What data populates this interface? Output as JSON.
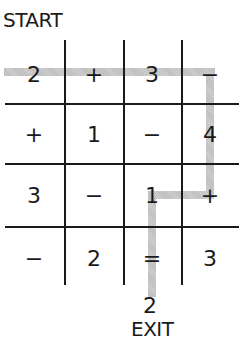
{
  "puzzle": {
    "start_label": "START",
    "exit_label": "EXIT",
    "exit_value": "2",
    "grid": [
      [
        "2",
        "+",
        "3",
        "−"
      ],
      [
        "+",
        "1",
        "−",
        "4"
      ],
      [
        "3",
        "−",
        "1",
        "+"
      ],
      [
        "−",
        "2",
        "=",
        "3"
      ]
    ],
    "path_cells": [
      [
        0,
        0
      ],
      [
        0,
        1
      ],
      [
        0,
        2
      ],
      [
        0,
        3
      ],
      [
        1,
        3
      ],
      [
        2,
        3
      ],
      [
        2,
        2
      ],
      [
        3,
        2
      ]
    ],
    "path_color": "#c4c4c4",
    "line_color": "#1a1a1a"
  }
}
